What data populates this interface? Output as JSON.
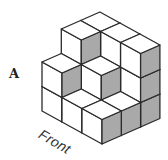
{
  "figure": {
    "label": "A",
    "view_label": "Front",
    "colors": {
      "stroke": "#2a2a2a",
      "top_face": "#ffffff",
      "left_face": "#ffffff",
      "shaded_face": "#a9a9a9",
      "background": "#ffffff"
    },
    "projection": {
      "origin": [
        102,
        144
      ],
      "axis_i": [
        19.3,
        -8.5
      ],
      "axis_j": [
        -20,
        -11
      ],
      "axis_up": [
        0,
        -24.5
      ]
    },
    "grid_size": [
      3,
      3
    ],
    "heights": [
      [
        1,
        1,
        2
      ],
      [
        1,
        2,
        3
      ],
      [
        3,
        3,
        3
      ]
    ],
    "heights_note_order": "heights[i][j]"
  }
}
